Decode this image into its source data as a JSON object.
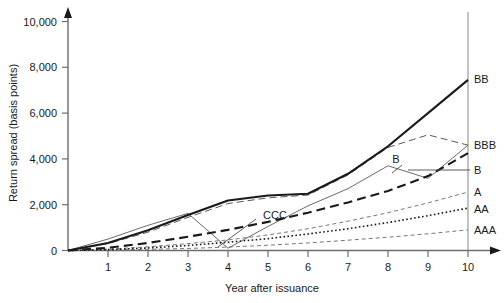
{
  "chart_data": {
    "type": "line",
    "title": "",
    "xlabel": "Year after issuance",
    "ylabel": "Return spread (basis points)",
    "xlim": [
      0,
      10
    ],
    "ylim": [
      0,
      10000
    ],
    "grid": false,
    "legend_position": "right-of-axis-endpoints",
    "x_ticks": [
      1,
      2,
      3,
      4,
      5,
      6,
      7,
      8,
      9,
      10
    ],
    "x_tick_labels": [
      "1",
      "2",
      "3",
      "4",
      "5",
      "6",
      "7",
      "8",
      "9",
      "10"
    ],
    "y_ticks": [
      0,
      2000,
      4000,
      6000,
      8000,
      10000
    ],
    "y_tick_labels": [
      "0",
      "2,000",
      "4,000",
      "6,000",
      "8,000",
      "10,000"
    ],
    "x": [
      0,
      1,
      2,
      3,
      4,
      5,
      6,
      7,
      8,
      9,
      10
    ],
    "series": [
      {
        "name": "BB",
        "label": "BB",
        "style": "solid-thick",
        "color": "#1a1a1a",
        "values": [
          0,
          330,
          880,
          1550,
          2180,
          2400,
          2480,
          3350,
          4550,
          6000,
          7450
        ]
      },
      {
        "name": "B",
        "label": "B",
        "style": "dashed-thick",
        "color": "#1a1a1a",
        "values": [
          0,
          120,
          330,
          600,
          900,
          1250,
          1650,
          2100,
          2600,
          3250,
          4250
        ]
      },
      {
        "name": "BBB",
        "label": "BBB",
        "style": "dashed-thin",
        "color": "#5a5a5a",
        "values": [
          0,
          300,
          800,
          1450,
          2050,
          2300,
          2420,
          3300,
          4500,
          5050,
          4600
        ]
      },
      {
        "name": "CCC",
        "label": "CCC",
        "style": "solid-thin",
        "color": "#5a5a5a",
        "values": [
          0,
          500,
          1100,
          1620,
          100,
          1050,
          1950,
          2700,
          3700,
          3150,
          4600
        ]
      },
      {
        "name": "A",
        "label": "A",
        "style": "dashed-fine",
        "color": "#6a6a6a",
        "values": [
          0,
          60,
          160,
          300,
          460,
          680,
          950,
          1280,
          1650,
          2080,
          2550
        ]
      },
      {
        "name": "AA",
        "label": "AA",
        "style": "dotted",
        "color": "#1a1a1a",
        "values": [
          0,
          40,
          110,
          220,
          360,
          520,
          720,
          950,
          1220,
          1520,
          1850
        ]
      },
      {
        "name": "AAA",
        "label": "AAA",
        "style": "dashed-fine",
        "color": "#6a6a6a",
        "values": [
          0,
          20,
          50,
          90,
          150,
          230,
          330,
          450,
          580,
          730,
          900
        ]
      }
    ],
    "annotations": [
      {
        "text": "CCC",
        "x_px": 263,
        "y_px": 216,
        "leader_to_x_px": 217,
        "leader_to_y_px": 247
      },
      {
        "text": "B",
        "x_px": 397,
        "y_px": 161,
        "leader_to_x_px": 388,
        "leader_to_y_px": 172
      }
    ],
    "axis_color": "#6e6e6e"
  }
}
